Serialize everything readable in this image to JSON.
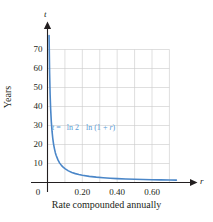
{
  "chart_data": {
    "type": "line",
    "title": "",
    "xlabel": "Rate compounded annually",
    "ylabel": "Years",
    "x_axis_variable": "r",
    "y_axis_variable": "t",
    "xlim": [
      0,
      0.78
    ],
    "ylim": [
      0,
      78
    ],
    "grid": true,
    "legend": null,
    "annotation": {
      "lhs": "t",
      "equals": "=",
      "numerator": "ln 2",
      "denominator_prefix": "ln (1",
      "denominator_plus": "+",
      "denominator_var": "r",
      "denominator_suffix": ")",
      "full_text": "t = ln 2 / ln (1 + r)",
      "color": "#5b9bd5"
    },
    "xticks": [
      {
        "value": 0,
        "label": "0"
      },
      {
        "value": 0.2,
        "label": "0.20"
      },
      {
        "value": 0.4,
        "label": "0.40"
      },
      {
        "value": 0.6,
        "label": "0.60"
      }
    ],
    "yticks": [
      {
        "value": 10,
        "label": "10"
      },
      {
        "value": 20,
        "label": "20"
      },
      {
        "value": 30,
        "label": "30"
      },
      {
        "value": 40,
        "label": "40"
      },
      {
        "value": 50,
        "label": "50"
      },
      {
        "value": 60,
        "label": "60"
      },
      {
        "value": 70,
        "label": "70"
      }
    ],
    "gridlines_x": [
      0.1,
      0.2,
      0.3,
      0.4,
      0.5,
      0.6,
      0.7
    ],
    "gridlines_y": [
      10,
      20,
      30,
      40,
      50,
      60,
      70
    ],
    "series": [
      {
        "name": "doubling-time",
        "color": "#4a86c8",
        "x": [
          0.009,
          0.012,
          0.015,
          0.018,
          0.022,
          0.026,
          0.03,
          0.035,
          0.04,
          0.045,
          0.05,
          0.06,
          0.07,
          0.08,
          0.09,
          0.1,
          0.12,
          0.14,
          0.16,
          0.18,
          0.2,
          0.24,
          0.28,
          0.32,
          0.36,
          0.4,
          0.45,
          0.5,
          0.55,
          0.6,
          0.65,
          0.7,
          0.74
        ],
        "y": [
          77.4,
          58.1,
          46.5,
          38.8,
          31.9,
          27.0,
          23.4,
          20.1,
          17.7,
          15.7,
          14.2,
          11.9,
          10.2,
          9.01,
          8.04,
          7.27,
          6.12,
          5.29,
          4.67,
          4.19,
          3.8,
          3.23,
          2.81,
          2.5,
          2.25,
          2.06,
          1.86,
          1.71,
          1.58,
          1.48,
          1.38,
          1.31,
          1.25
        ],
        "linewidth": 1.6
      }
    ]
  },
  "axis_arrow_labels": {
    "y_top": "t",
    "x_right": "r"
  }
}
